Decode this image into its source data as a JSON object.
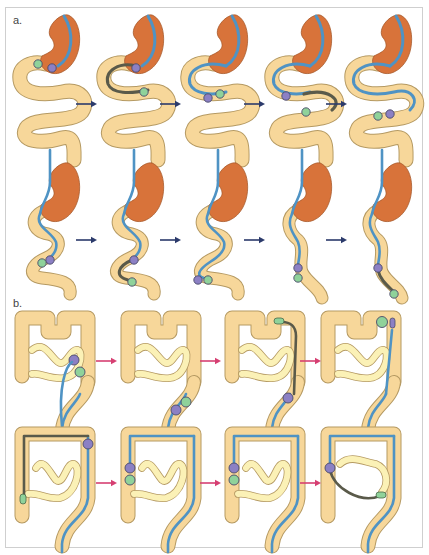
{
  "figure": {
    "panels": [
      {
        "label": "a.",
        "subject": "stomach and small intestine",
        "arrow_color": "#2b3a6b",
        "stages": [
          {
            "row": 1,
            "col": 1,
            "scope": "in stomach, entering duodenum"
          },
          {
            "row": 1,
            "col": 2,
            "scope": "overtube advanced (dark segment)"
          },
          {
            "row": 1,
            "col": 3,
            "scope": "balloons at first loop"
          },
          {
            "row": 1,
            "col": 4,
            "scope": "dark segment advanced to next loop"
          },
          {
            "row": 1,
            "col": 5,
            "scope": "balloons at second loop"
          },
          {
            "row": 2,
            "col": 1,
            "scope": "bowel pleated, balloons mid"
          },
          {
            "row": 2,
            "col": 2,
            "scope": "dark segment lower"
          },
          {
            "row": 2,
            "col": 3,
            "scope": "balloons at lower loop"
          },
          {
            "row": 2,
            "col": 4,
            "scope": "intestine straightened"
          },
          {
            "row": 2,
            "col": 5,
            "scope": "dark segment advanced further"
          }
        ]
      },
      {
        "label": "b.",
        "subject": "colon",
        "arrow_color": "#d63f72",
        "stages": [
          {
            "row": 1,
            "col": 1,
            "scope": "balloons at sigmoid"
          },
          {
            "row": 1,
            "col": 2,
            "scope": "balloons at descending colon"
          },
          {
            "row": 1,
            "col": 3,
            "scope": "dark segment in descending colon"
          },
          {
            "row": 1,
            "col": 4,
            "scope": "balloons at splenic flexure"
          },
          {
            "row": 2,
            "col": 1,
            "scope": "dark segment across transverse colon"
          },
          {
            "row": 2,
            "col": 2,
            "scope": "balloons at ascending colon"
          },
          {
            "row": 2,
            "col": 3,
            "scope": "balloons at ascending colon, small bowel visible"
          },
          {
            "row": 2,
            "col": 4,
            "scope": "dark segment into terminal ileum"
          }
        ]
      }
    ],
    "colors": {
      "intestine_fill": "#f7d79a",
      "intestine_stroke": "#b59a63",
      "small_bowel_fill": "#fbf1b6",
      "stomach_fill": "#d8733a",
      "scope_blue": "#4f93c4",
      "scope_dark": "#5a5a4a",
      "balloon_purple": "#8c80c4",
      "balloon_green": "#8fd29a",
      "frame_border": "#cfcfcf"
    }
  }
}
